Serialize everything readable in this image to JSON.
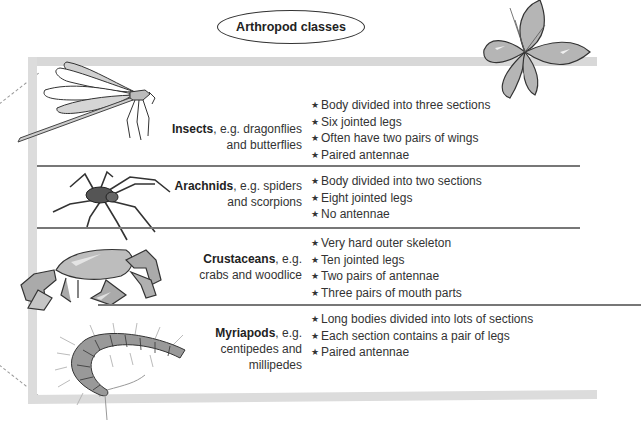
{
  "title": "Arthropod classes",
  "rows": [
    {
      "class_name": "Insects",
      "examples_line1": ", e.g. dragonflies",
      "examples_line2": "and butterflies",
      "illustration": "dragonfly-illustration",
      "facts": [
        "Body divided into three sections",
        "Six jointed legs",
        "Often have two pairs of wings",
        "Paired antennae"
      ]
    },
    {
      "class_name": "Arachnids",
      "examples_line1": ", e.g. spiders",
      "examples_line2": "and scorpions",
      "illustration": "spider-illustration",
      "facts": [
        "Body divided into two sections",
        "Eight jointed legs",
        "No antennae"
      ]
    },
    {
      "class_name": "Crustaceans",
      "examples_line1": ", e.g.",
      "examples_line2": "crabs and woodlice",
      "illustration": "crab-illustration",
      "facts": [
        "Very hard outer skeleton",
        "Ten jointed legs",
        "Two pairs of antennae",
        "Three pairs of mouth parts"
      ]
    },
    {
      "class_name": "Myriapods",
      "examples_line1": ", e.g.",
      "examples_line2": "centipedes and",
      "examples_line3": "millipedes",
      "illustration": "centipede-illustration",
      "facts": [
        "Long bodies divided into lots of sections",
        "Each section contains a pair of legs",
        "Paired antennae"
      ]
    }
  ],
  "bullet_glyph": "★",
  "decorations": [
    "butterfly-illustration"
  ],
  "colors": {
    "frame": "#d8d8d8",
    "separator": "#777777",
    "text": "#333333"
  }
}
